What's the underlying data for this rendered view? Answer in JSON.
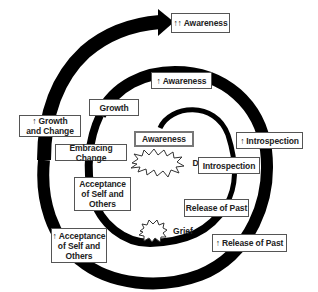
{
  "diagram": {
    "type": "spiral-growth-diagram",
    "stroke_color": "#000000",
    "arrow_icon": "up-arrow-icon",
    "arrow_glyph": "↑",
    "inner_loop": {
      "awareness": "Awareness",
      "discomfort": "Discomfort",
      "introspection": "Introspection",
      "release_of_past": "Release of Past",
      "grief": "Grief",
      "acceptance": "Acceptance\nof Self and\nOthers",
      "embracing_change": "Embracing Change"
    },
    "middle_loop": {
      "growth": "Growth",
      "awareness_up": "Awareness",
      "introspection_up": "Introspection",
      "release_of_past_up": "Release of Past",
      "acceptance_up_line1": "Acceptance",
      "acceptance_up_rest": "of Self and\nOthers",
      "growth_and_change_line1": "Growth",
      "growth_and_change_line2": "and Change"
    },
    "outer_loop": {
      "awareness_double_up": "Awareness",
      "double_arrow": "↑↑"
    }
  }
}
